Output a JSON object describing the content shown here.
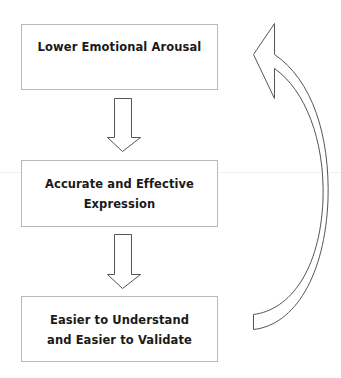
{
  "diagram": {
    "type": "flow-cycle",
    "nodes": [
      {
        "id": "lower-arousal",
        "lines": [
          "Lower Emotional Arousal"
        ]
      },
      {
        "id": "accurate-expression",
        "lines": [
          "Accurate and Effective",
          "Expression"
        ]
      },
      {
        "id": "easier-validate",
        "lines": [
          "Easier to Understand",
          "and Easier to Validate"
        ]
      }
    ],
    "edges": [
      {
        "from": "lower-arousal",
        "to": "accurate-expression",
        "style": "block-arrow-down"
      },
      {
        "from": "accurate-expression",
        "to": "easier-validate",
        "style": "block-arrow-down"
      },
      {
        "from": "easier-validate",
        "to": "lower-arousal",
        "style": "curved-block-arrow-up"
      }
    ],
    "colors": {
      "text": "#1a1a1a",
      "box_border": "#b8b8b8",
      "arrow_stroke": "#555555",
      "background": "#ffffff"
    }
  }
}
